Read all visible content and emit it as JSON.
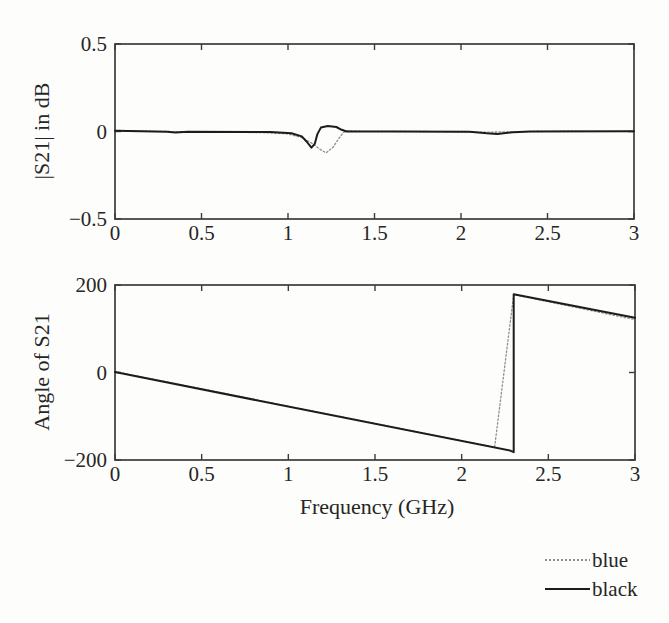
{
  "legend": {
    "items": [
      {
        "label": "blue",
        "color": "#8f8f8f",
        "style": "dotted"
      },
      {
        "label": "black",
        "color": "#1c1c1c",
        "style": "solid"
      }
    ]
  },
  "chart_data": [
    {
      "type": "line",
      "title": "",
      "xlabel": "",
      "ylabel": "|S21| in dB",
      "xlim": [
        0,
        3
      ],
      "ylim": [
        -0.5,
        0.5
      ],
      "xticks": [
        0,
        0.5,
        1,
        1.5,
        2,
        2.5,
        3
      ],
      "xtick_labels": [
        "0",
        "0.5",
        "1",
        "1.5",
        "2",
        "2.5",
        "3"
      ],
      "yticks": [
        -0.5,
        0,
        0.5
      ],
      "ytick_labels": [
        "−0.5",
        "0",
        "0.5"
      ],
      "grid": false,
      "box": true,
      "series": [
        {
          "name": "blue",
          "color": "#8f8f8f",
          "style": "dotted",
          "width": 1.3,
          "points": [
            [
              0,
              0.006
            ],
            [
              0.2,
              0.002
            ],
            [
              0.5,
              -0.003
            ],
            [
              0.85,
              -0.006
            ],
            [
              1.0,
              -0.014
            ],
            [
              1.08,
              -0.035
            ],
            [
              1.14,
              -0.068
            ],
            [
              1.19,
              -0.105
            ],
            [
              1.22,
              -0.122
            ],
            [
              1.26,
              -0.09
            ],
            [
              1.29,
              -0.045
            ],
            [
              1.32,
              -0.005
            ],
            [
              1.35,
              0.005
            ],
            [
              1.42,
              0.001
            ],
            [
              1.8,
              0
            ],
            [
              2.1,
              -0.004
            ],
            [
              2.3,
              -0.002
            ],
            [
              2.6,
              0.002
            ],
            [
              3,
              0
            ]
          ]
        },
        {
          "name": "black",
          "color": "#1c1c1c",
          "style": "solid",
          "width": 2,
          "points": [
            [
              0,
              0.004
            ],
            [
              0.3,
              -0.001
            ],
            [
              0.35,
              -0.006
            ],
            [
              0.42,
              -0.002
            ],
            [
              0.9,
              -0.003
            ],
            [
              1.02,
              -0.01
            ],
            [
              1.08,
              -0.028
            ],
            [
              1.11,
              -0.06
            ],
            [
              1.135,
              -0.092
            ],
            [
              1.155,
              -0.07
            ],
            [
              1.17,
              -0.015
            ],
            [
              1.19,
              0.022
            ],
            [
              1.23,
              0.031
            ],
            [
              1.28,
              0.026
            ],
            [
              1.31,
              0.01
            ],
            [
              1.34,
              0
            ],
            [
              1.6,
              0
            ],
            [
              2.05,
              -0.002
            ],
            [
              2.15,
              -0.01
            ],
            [
              2.21,
              -0.014
            ],
            [
              2.3,
              -0.004
            ],
            [
              2.4,
              0
            ],
            [
              3,
              0.001
            ]
          ]
        }
      ]
    },
    {
      "type": "line",
      "title": "",
      "xlabel": "Frequency (GHz)",
      "ylabel": "Angle of S21",
      "xlim": [
        0,
        3
      ],
      "ylim": [
        -200,
        200
      ],
      "xticks": [
        0,
        0.5,
        1,
        1.5,
        2,
        2.5,
        3
      ],
      "xtick_labels": [
        "0",
        "0.5",
        "1",
        "1.5",
        "2",
        "2.5",
        "3"
      ],
      "yticks": [
        -200,
        0,
        200
      ],
      "ytick_labels": [
        "−200",
        "0",
        "200"
      ],
      "grid": false,
      "box": true,
      "series": [
        {
          "name": "blue",
          "color": "#8f8f8f",
          "style": "dotted",
          "width": 1.3,
          "points": [
            [
              0,
              2
            ],
            [
              2.19,
              -171
            ],
            [
              2.3,
              178
            ],
            [
              3,
              121
            ]
          ]
        },
        {
          "name": "black",
          "color": "#1c1c1c",
          "style": "solid",
          "width": 2,
          "points": [
            [
              0,
              1
            ],
            [
              2.28,
              -178.5
            ],
            [
              2.3,
              -182
            ],
            [
              2.3,
              179
            ],
            [
              3,
              125
            ]
          ]
        }
      ]
    }
  ]
}
